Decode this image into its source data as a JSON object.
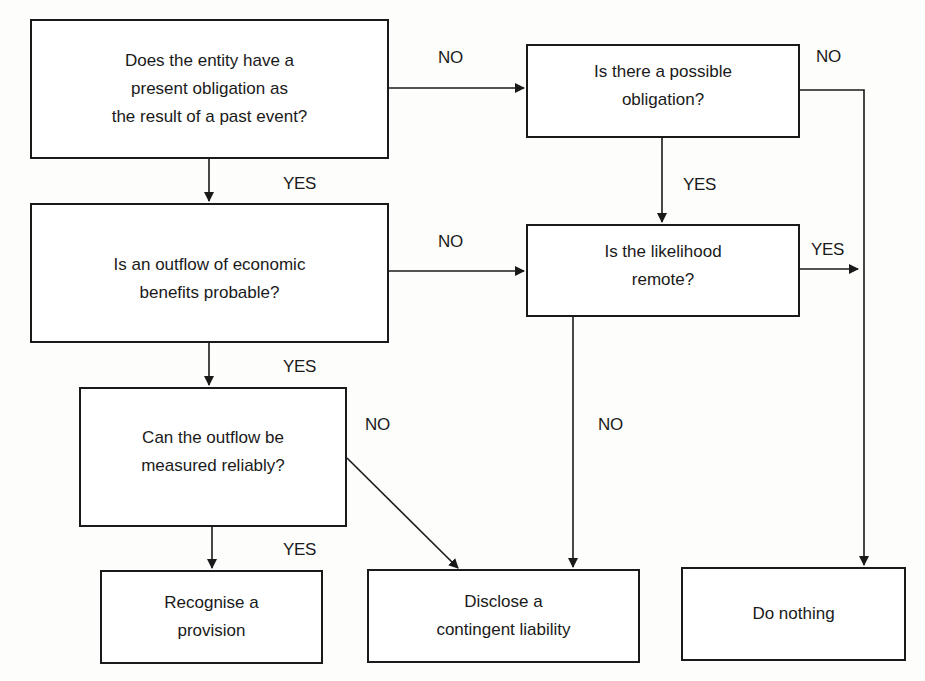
{
  "diagram": {
    "type": "flowchart",
    "nodes": [
      {
        "id": "q_present_obligation",
        "kind": "decision",
        "text": "Does the entity have a\npresent obligation as\nthe result of a past event?"
      },
      {
        "id": "q_possible_obligation",
        "kind": "decision",
        "text": "Is there a possible\nobligation?"
      },
      {
        "id": "q_outflow_probable",
        "kind": "decision",
        "text": "Is an outflow of economic\nbenefits probable?"
      },
      {
        "id": "q_likelihood_remote",
        "kind": "decision",
        "text": "Is the likelihood\nremote?"
      },
      {
        "id": "q_measured_reliably",
        "kind": "decision",
        "text": "Can the outflow be\nmeasured reliably?"
      },
      {
        "id": "r_recognise_provision",
        "kind": "outcome",
        "text": "Recognise a\nprovision"
      },
      {
        "id": "r_disclose_contingent",
        "kind": "outcome",
        "text": "Disclose a\ncontingent liability"
      },
      {
        "id": "r_do_nothing",
        "kind": "outcome",
        "text": "Do nothing"
      }
    ],
    "edges": [
      {
        "from": "q_present_obligation",
        "to": "q_possible_obligation",
        "label": "NO"
      },
      {
        "from": "q_present_obligation",
        "to": "q_outflow_probable",
        "label": "YES"
      },
      {
        "from": "q_possible_obligation",
        "to": "r_do_nothing",
        "label": "NO"
      },
      {
        "from": "q_possible_obligation",
        "to": "q_likelihood_remote",
        "label": "YES"
      },
      {
        "from": "q_outflow_probable",
        "to": "q_likelihood_remote",
        "label": "NO"
      },
      {
        "from": "q_outflow_probable",
        "to": "q_measured_reliably",
        "label": "YES"
      },
      {
        "from": "q_likelihood_remote",
        "to": "r_do_nothing",
        "label": "YES"
      },
      {
        "from": "q_likelihood_remote",
        "to": "r_disclose_contingent",
        "label": "NO"
      },
      {
        "from": "q_measured_reliably",
        "to": "r_disclose_contingent",
        "label": "NO"
      },
      {
        "from": "q_measured_reliably",
        "to": "r_recognise_provision",
        "label": "YES"
      }
    ]
  }
}
